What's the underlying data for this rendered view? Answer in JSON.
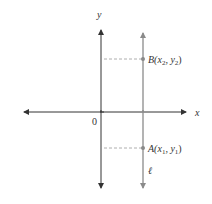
{
  "diagram": {
    "axes": {
      "x_label": "x",
      "y_label": "y",
      "origin_label": "0"
    },
    "line": {
      "label": "ℓ",
      "color": "#8a8a8a"
    },
    "points": [
      {
        "name": "B",
        "label_prefix": "B(",
        "x_sub": "x",
        "x_index": "2",
        "sep": ", ",
        "y_sub": "y",
        "y_index": "2",
        "close": ")"
      },
      {
        "name": "A",
        "label_prefix": "A(",
        "x_sub": "x",
        "x_index": "1",
        "sep": ", ",
        "y_sub": "y",
        "y_index": "1",
        "close": ")"
      }
    ],
    "colors": {
      "axis": "#333333",
      "line": "#8a8a8a",
      "dash": "#999999",
      "point": "#8a8a8a"
    }
  }
}
